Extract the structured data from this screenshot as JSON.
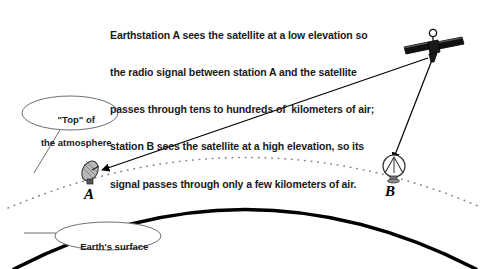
{
  "diagram": {
    "title_caption": {
      "lines": [
        "Earthstation A sees the satellite at a low elevation so",
        "the radio signal between station A and the satellite",
        "passes through tens to hundreds of  kilometers of air;",
        "station B sees the satellite at a high elevation, so its",
        "signal passes through only a few kilometers of air."
      ]
    },
    "callouts": {
      "atmosphere": {
        "line1": "\"Top\" of",
        "line2": "the atmosphere"
      },
      "surface": {
        "line1": "Earth's surface"
      }
    },
    "stations": [
      {
        "id": "a",
        "label": "A",
        "icon": "satellite-dish-side-icon"
      },
      {
        "id": "b",
        "label": "B",
        "icon": "satellite-dish-front-icon"
      }
    ],
    "satellite": {
      "icon": "satellite-icon"
    },
    "signal_paths": [
      {
        "name": "satellite-to-station-a",
        "description": "low elevation long path"
      },
      {
        "name": "satellite-to-station-b",
        "description": "high elevation short path"
      }
    ],
    "colors": {
      "ink": "#000000",
      "text": "#1a1a1a",
      "background": "#ffffff",
      "atmosphere_dots": "#8a8a8a",
      "callout_outline": "#6e6e6e",
      "dish_fill": "#b8b8b8"
    }
  }
}
